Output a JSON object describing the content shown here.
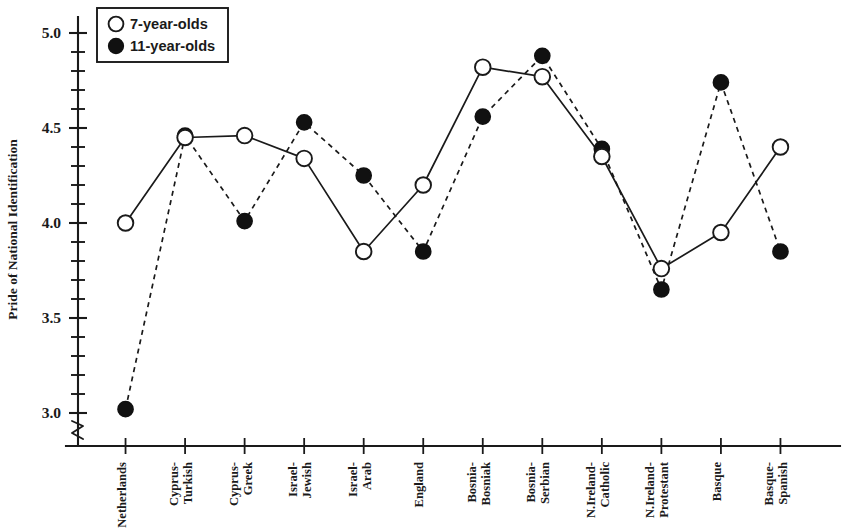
{
  "chart_data": {
    "type": "line",
    "title": "",
    "xlabel": "",
    "ylabel": "Pride of National Identification",
    "ylim": [
      2.85,
      5.05
    ],
    "yticks_major": [
      "3.0",
      "3.5",
      "4.0",
      "4.5",
      "5.0"
    ],
    "ytick_values": [
      3.0,
      3.5,
      4.0,
      4.5,
      5.0
    ],
    "ytick_minor_step": 0.1,
    "grid": false,
    "axis_break": true,
    "legend_position": "top-left",
    "categories": [
      "Netherlands",
      "Cyprus-Turkish",
      "Cyprus-Greek",
      "Israel-Jewish",
      "Israel-Arab",
      "England",
      "Bosnia-Bosniak",
      "Bosnia-Serbian",
      "N.Ireland-Catholic",
      "N.Ireland-Protestant",
      "Basque",
      "Basque-Spanish"
    ],
    "series": [
      {
        "name": "7-year-olds",
        "marker": "open-circle",
        "line_style": "solid",
        "values": [
          4.0,
          4.45,
          4.46,
          4.34,
          3.85,
          4.2,
          4.82,
          4.77,
          4.35,
          3.76,
          3.95,
          4.4
        ]
      },
      {
        "name": "11-year-olds",
        "marker": "filled-circle",
        "line_style": "dashed",
        "values": [
          3.02,
          4.46,
          4.01,
          4.53,
          4.25,
          3.85,
          4.56,
          4.88,
          4.39,
          3.65,
          4.74,
          3.85
        ]
      }
    ]
  },
  "legend": {
    "items": [
      {
        "label": "7-year-olds",
        "marker": "open-circle"
      },
      {
        "label": "11-year-olds",
        "marker": "filled-circle"
      }
    ]
  },
  "axes": {
    "y_title": "Pride of National Identification"
  }
}
